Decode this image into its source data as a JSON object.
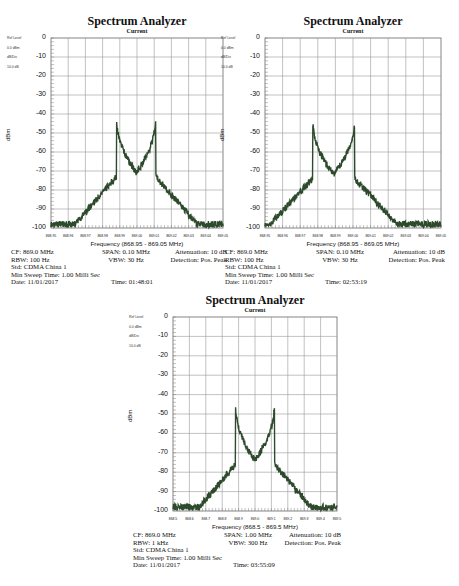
{
  "chart_data": [
    {
      "type": "line",
      "title": "Spectrum Analyzer",
      "subtitle": "Current",
      "ref_labels": [
        "Ref Level",
        "0.0 dBm",
        "dB/Div",
        "10.0 dB"
      ],
      "xlabel": "Frequency (868.95 - 869.05 MHz)",
      "ylabel": "dBm",
      "ylim": [
        -100,
        0
      ],
      "xlim": [
        868.95,
        869.05
      ],
      "yticks": [
        "0",
        "-10",
        "-20",
        "-30",
        "-40",
        "-50",
        "-60",
        "-70",
        "-80",
        "-90",
        "-100"
      ],
      "xticks": [
        "868.95",
        "868.96",
        "868.97",
        "868.98",
        "868.99",
        "869.00",
        "869.01",
        "869.02",
        "869.03",
        "869.04",
        "869.05"
      ],
      "grid": true,
      "series": [
        {
          "name": "Trace",
          "color": "#2d4a2d",
          "peaks": [
            {
              "x": 868.988,
              "y": -40
            },
            {
              "x": 869.011,
              "y": -40
            }
          ],
          "center_floor": -75,
          "noise_floor": -98
        }
      ],
      "info": {
        "cf": "CF: 869.0 MHz",
        "span": "SPAN: 0.10 MHz",
        "attenuation": "Attenuation: 10 dB",
        "rbw": "RBW: 100 Hz",
        "vbw": "VBW: 30 Hz",
        "detection": "Detection: Pos. Peak",
        "std": "Std: CDMA China 1",
        "sweep": "Min Sweep Time: 1.00 Milli Sec",
        "date": "Date: 11/01/2017",
        "time": "Time: 01:48:01"
      }
    },
    {
      "type": "line",
      "title": "Spectrum Analyzer",
      "subtitle": "Current",
      "ref_labels": [
        "Ref Level",
        "0.0 dBm",
        "dB/Div",
        "10.0 dB"
      ],
      "xlabel": "Frequency (868.95 - 869.05 MHz)",
      "ylabel": "dBm",
      "ylim": [
        -100,
        0
      ],
      "xlim": [
        868.95,
        869.05
      ],
      "yticks": [
        "0",
        "-10",
        "-20",
        "-30",
        "-40",
        "-50",
        "-60",
        "-70",
        "-80",
        "-90",
        "-100"
      ],
      "xticks": [
        "868.95",
        "868.96",
        "868.97",
        "868.98",
        "868.99",
        "869.00",
        "869.01",
        "869.02",
        "869.03",
        "869.04",
        "869.05"
      ],
      "grid": true,
      "series": [
        {
          "name": "Trace",
          "color": "#2d4a2d",
          "peaks": [
            {
              "x": 868.977,
              "y": -41
            },
            {
              "x": 869.001,
              "y": -41
            }
          ],
          "center_floor": -76,
          "noise_floor": -98
        }
      ],
      "info": {
        "cf": "CF: 869.0 MHz",
        "span": "SPAN: 0.10 MHz",
        "attenuation": "Attenuation: 10 dB",
        "rbw": "RBW: 100 Hz",
        "vbw": "VBW: 30 Hz",
        "detection": "Detection: Pos. Peak",
        "std": "Std: CDMA China 1",
        "sweep": "Min Sweep Time: 1.00 Milli Sec",
        "date": "Date: 11/01/2017",
        "time": "Time: 02:53:19"
      }
    },
    {
      "type": "line",
      "title": "Spectrum Analyzer",
      "subtitle": "Current",
      "ref_labels": [
        "Ref Level",
        "0.0 dBm",
        "dB/Div",
        "10.0 dB"
      ],
      "xlabel": "Frequency (868.5 - 869.5 MHz)",
      "ylabel": "dBm",
      "ylim": [
        -100,
        0
      ],
      "xlim": [
        868.5,
        869.5
      ],
      "yticks": [
        "0",
        "-10",
        "-20",
        "-30",
        "-40",
        "-50",
        "-60",
        "-70",
        "-80",
        "-90",
        "-100"
      ],
      "xticks": [
        "868.5",
        "868.6",
        "868.7",
        "868.8",
        "868.9",
        "869.0",
        "869.1",
        "869.2",
        "869.3",
        "869.4",
        "869.5"
      ],
      "grid": true,
      "series": [
        {
          "name": "Trace",
          "color": "#2d4a2d",
          "peaks": [
            {
              "x": 868.88,
              "y": -43
            },
            {
              "x": 869.12,
              "y": -43
            }
          ],
          "center_floor": -77,
          "noise_floor": -98
        }
      ],
      "info": {
        "cf": "CF: 869.0 MHz",
        "span": "SPAN: 1.00 MHz",
        "attenuation": "Attenuation: 10 dB",
        "rbw": "RBW: 1 kHz",
        "vbw": "VBW: 300 Hz",
        "detection": "Detection: Pos. Peak",
        "std": "Std: CDMA China 1",
        "sweep": "Min Sweep Time: 1.00 Milli Sec",
        "date": "Date: 11/01/2017",
        "time": "Time: 03:55:09"
      }
    }
  ]
}
